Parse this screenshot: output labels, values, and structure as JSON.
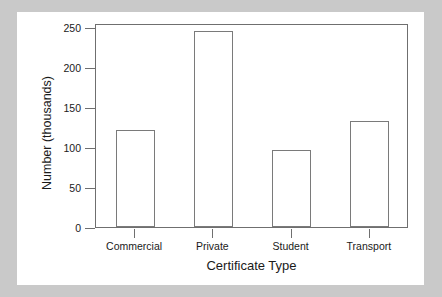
{
  "chart_data": {
    "type": "bar",
    "title": "",
    "xlabel": "Certificate Type",
    "ylabel": "Number (thousands)",
    "categories": [
      "Commercial",
      "Private",
      "Student",
      "Transport"
    ],
    "values": [
      121,
      245,
      96,
      132
    ],
    "ylim": [
      0,
      255
    ],
    "yticks": [
      0,
      50,
      100,
      150,
      200,
      250
    ],
    "ytick_labels": [
      "0",
      "50",
      "100",
      "150",
      "200",
      "250"
    ],
    "grid": false,
    "legend": "none",
    "bar_face_color": "#ffffff",
    "bar_edge_color": "#7a7a7a",
    "axis_color": "#6f6f6f",
    "text_color": "#1a1a1a",
    "plot_background": "#ffffff",
    "page_background": "#c9c9c9"
  }
}
